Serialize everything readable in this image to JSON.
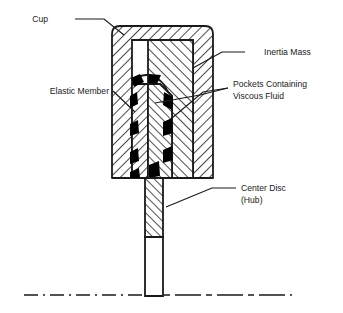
{
  "figure": {
    "background_color": "#ffffff",
    "line_color": "#1a1a1a",
    "fill_color": "#000000",
    "hatch_color": "#1a1a1a"
  },
  "labels": {
    "cup": "Cup",
    "elastic_member": "Elastic Member",
    "inertia_mass": "Inertia Mass",
    "pockets_line1": "Pockets Containing",
    "pockets_line2": "Viscous Fluid",
    "center_disc_line1": "Center Disc",
    "center_disc_line2": "(Hub)"
  },
  "parts": [
    {
      "name": "cup",
      "description": "Outer hatched cup enclosing the assembly"
    },
    {
      "name": "inertia-mass",
      "description": "Large hatched inertia mass inside the cup"
    },
    {
      "name": "elastic-member",
      "description": "Vertical elastic member between hub and inertia mass"
    },
    {
      "name": "viscous-pockets",
      "description": "Solid black pockets containing viscous fluid"
    },
    {
      "name": "center-disc-hub",
      "description": "Central hub shaft extending downward"
    },
    {
      "name": "centerline",
      "description": "Dash-dot axis centerline at bottom"
    }
  ]
}
